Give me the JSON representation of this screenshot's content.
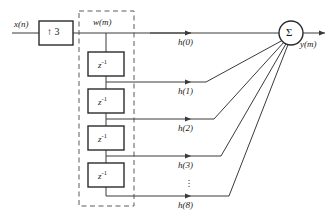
{
  "diagram": {
    "background_color": "#ffffff",
    "line_color": "#3a3a3a",
    "text_color": "#1a1a1a",
    "input": {
      "label": "x(n)",
      "name": "input-signal-label"
    },
    "upsampler": {
      "arrow_glyph": "↑",
      "factor": "3",
      "label": "↑ 3",
      "name": "upsampler-block"
    },
    "intermediate": {
      "label": "w(m)",
      "name": "intermediate-signal-label"
    },
    "delay_line": {
      "dashed_box_label": "delay-line-group",
      "block_label": "z",
      "block_exponent": "-1",
      "blocks": [
        {
          "label": "z",
          "exponent": "-1"
        },
        {
          "label": "z",
          "exponent": "-1"
        },
        {
          "label": "z",
          "exponent": "-1"
        },
        {
          "label": "z",
          "exponent": "-1"
        }
      ]
    },
    "taps": [
      {
        "label": "h(0)",
        "name": "tap-label-h0"
      },
      {
        "label": "h(1)",
        "name": "tap-label-h1"
      },
      {
        "label": "h(2)",
        "name": "tap-label-h2"
      },
      {
        "label": "h(3)",
        "name": "tap-label-h3"
      },
      {
        "label": "h(8)",
        "name": "tap-label-h8"
      }
    ],
    "ellipsis": {
      "glyph": "⋮",
      "name": "vertical-ellipsis"
    },
    "adder": {
      "symbol": "Σ",
      "name": "summation-node"
    },
    "output": {
      "label": "y(m)",
      "name": "output-signal-label"
    }
  }
}
